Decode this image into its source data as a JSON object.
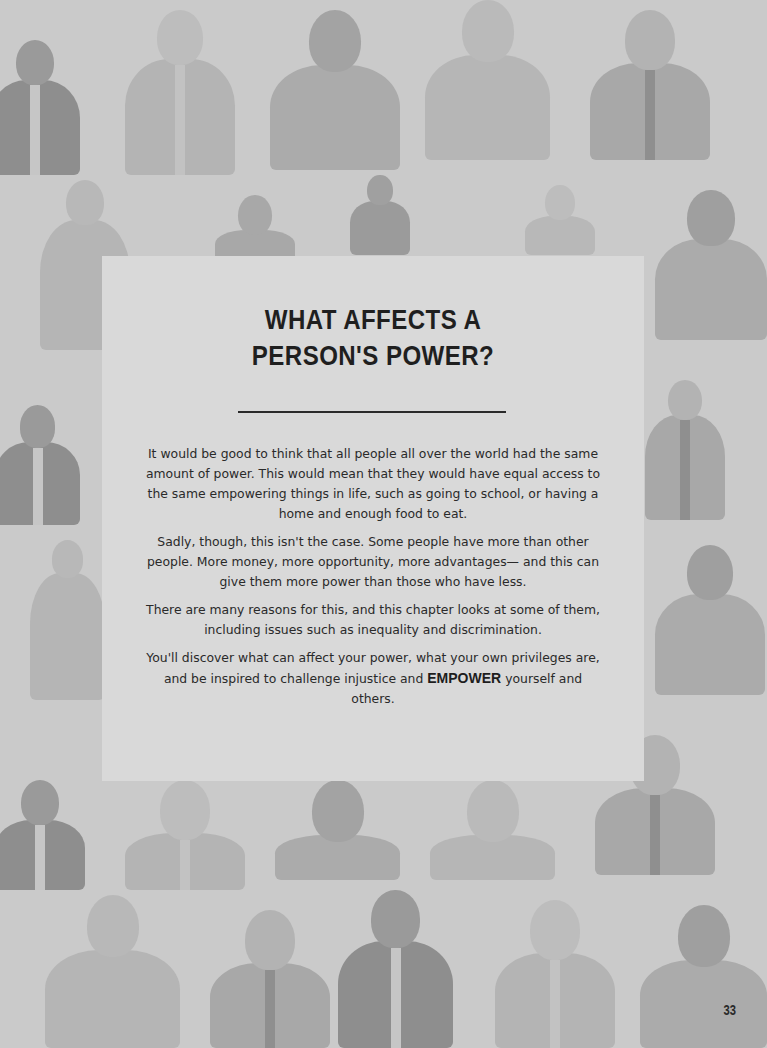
{
  "page": {
    "background_color": "#cacaca",
    "panel_color": "#d9d9d9",
    "text_color": "#2a2a2a"
  },
  "chapter": {
    "title_line1": "WHAT AFFECTS A",
    "title_line2": "PERSON'S POWER?",
    "paragraphs": [
      "It would be good to think that all people all over the world had the same amount of power. This would mean that they would have equal access to the same empowering things in life, such as going to school, or having a home and enough food to eat.",
      "Sadly, though, this isn't the case. Some people have more than other people. More money, more opportunity, more advantages— and this can give them more power than those who have less.",
      "There are many reasons for this, and this chapter looks at some of them, including issues such as inequality and discrimination."
    ],
    "closing": {
      "before": "You'll discover what can affect your power, what your own privileges are, and be inspired to challenge injustice and",
      "emphasis": "EMPOWER",
      "after": "yourself and others."
    }
  },
  "page_number": "33",
  "background_illustration": {
    "description": "repeating grid of illustrated portraits of people, faded grey"
  }
}
